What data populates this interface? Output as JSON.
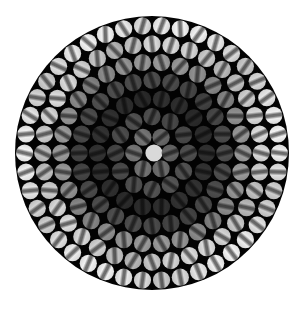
{
  "image": {
    "width": 299,
    "height": 309,
    "background": "#ffffff",
    "subject": "fiber optic bundle cross-section",
    "bundle": {
      "center_x": 152,
      "center_y": 153,
      "radius": 137,
      "fill": "#030303"
    },
    "fibers": {
      "layout": "concentric-hexagonal-rings",
      "ring_count": 7,
      "ring_spacing": 18.2,
      "fiber_radius": 8.6,
      "center_fiber_color": "#d9d9d9",
      "ring_brightness": [
        0.88,
        0.42,
        0.3,
        0.18,
        0.28,
        0.55,
        0.78,
        0.86
      ],
      "stripe_darkness": 0.45,
      "stripe_width_ratio": 0.28
    }
  }
}
